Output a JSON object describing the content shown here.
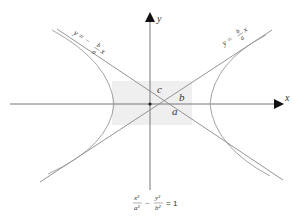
{
  "diagram": {
    "type": "hyperbola",
    "equation": {
      "term1_num": "x²",
      "term1_den": "a²",
      "minus": "−",
      "term2_num": "y²",
      "term2_den": "b²",
      "equals": "= 1"
    },
    "axes": {
      "x_label": "x",
      "y_label": "y"
    },
    "asymptotes": {
      "positive": {
        "prefix": "y =",
        "num": "b",
        "den": "a",
        "var": "x"
      },
      "negative": {
        "prefix": "y = −",
        "num": "b",
        "den": "a",
        "var": "x"
      }
    },
    "segment_labels": {
      "a": "a",
      "b": "b",
      "c": "c"
    },
    "colors": {
      "curve": "#888888",
      "axis": "#777777",
      "shade": "#eeeeee",
      "text": "#333333",
      "arrow": "#111111"
    }
  }
}
